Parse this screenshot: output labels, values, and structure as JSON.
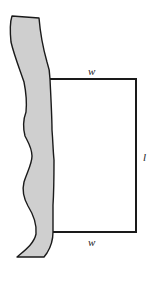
{
  "diagram": {
    "type": "fenced-rectangular-field-along-river",
    "colors": {
      "river_fill": "#cfcfcf",
      "outline": "#1a1a1a",
      "background": "#ffffff"
    },
    "labels": {
      "top_side": "w",
      "right_side": "l",
      "bottom_side": "w"
    }
  }
}
